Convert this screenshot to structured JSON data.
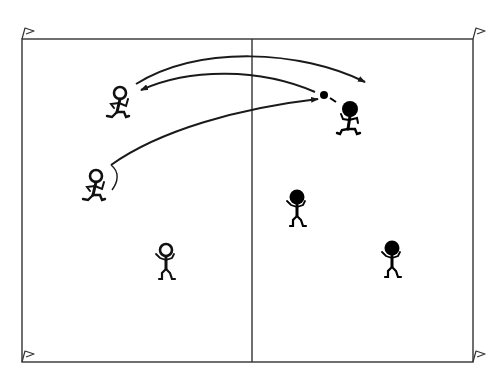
{
  "diagram": {
    "type": "sports-drill",
    "colors": {
      "line": "#1a1a1a",
      "team_open": "#ffffff",
      "team_filled": "#000000",
      "background": "#ffffff"
    },
    "court": {
      "x": 22,
      "y": 39,
      "width": 451,
      "height": 323,
      "center_line_x": 252
    },
    "corner_flags": [
      {
        "name": "flag-top-left",
        "x": 22,
        "y": 39
      },
      {
        "name": "flag-top-right",
        "x": 473,
        "y": 39
      },
      {
        "name": "flag-bottom-left",
        "x": 22,
        "y": 362
      },
      {
        "name": "flag-bottom-right",
        "x": 473,
        "y": 362
      }
    ],
    "players": [
      {
        "name": "player-open-1",
        "team": "open",
        "pose": "running",
        "x": 122,
        "y": 92
      },
      {
        "name": "player-open-2",
        "team": "open",
        "pose": "running",
        "x": 97,
        "y": 175
      },
      {
        "name": "player-open-3",
        "team": "open",
        "pose": "standing",
        "x": 166,
        "y": 250
      },
      {
        "name": "player-filled-1",
        "team": "filled",
        "pose": "running",
        "x": 349,
        "y": 108
      },
      {
        "name": "player-filled-2",
        "team": "filled",
        "pose": "standing",
        "x": 297,
        "y": 196
      },
      {
        "name": "player-filled-3",
        "team": "filled",
        "pose": "standing",
        "x": 392,
        "y": 247
      }
    ],
    "ball": {
      "x": 324,
      "y": 95
    },
    "arrows": [
      {
        "name": "arrow-pass-top",
        "from": "player-open-1",
        "to": "right-court"
      },
      {
        "name": "arrow-return",
        "from": "ball",
        "to": "player-open-1"
      },
      {
        "name": "arrow-pass-low",
        "from": "player-open-2",
        "to": "ball"
      }
    ]
  }
}
